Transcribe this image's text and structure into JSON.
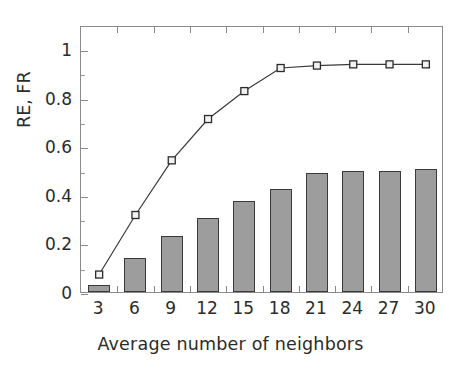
{
  "chart_data": {
    "type": "bar",
    "title": "",
    "subtitle": "",
    "xlabel": "Average number of neighbors",
    "ylabel": "RE, FR",
    "categories": [
      "3",
      "6",
      "9",
      "12",
      "15",
      "18",
      "21",
      "24",
      "27",
      "30"
    ],
    "x": [
      3,
      6,
      9,
      12,
      15,
      18,
      21,
      24,
      27,
      30
    ],
    "xlim": [
      1.5,
      31.5
    ],
    "ylim": [
      0,
      1.1
    ],
    "yticks": [
      0,
      0.2,
      0.4,
      0.6,
      0.8,
      1
    ],
    "ytick_labels": [
      "0",
      "0.2",
      "0.4",
      "0.6",
      "0.8",
      "1"
    ],
    "grid": false,
    "legend": "none",
    "series": [
      {
        "name": "RE",
        "render": "bar",
        "marker": "none",
        "fill_color": "#9d9d9d",
        "edge_color": "#3a3a3a",
        "values": [
          0.03,
          0.14,
          0.23,
          0.305,
          0.375,
          0.425,
          0.49,
          0.5,
          0.5,
          0.505
        ]
      },
      {
        "name": "FR",
        "render": "line",
        "marker": "open-square",
        "line_color": "#3a3a3a",
        "marker_fill": "#f2f2f2",
        "marker_edge": "#2b2b2b",
        "values": [
          0.08,
          0.325,
          0.55,
          0.72,
          0.835,
          0.93,
          0.94,
          0.945,
          0.945,
          0.945
        ]
      }
    ]
  },
  "axes": {
    "ytick_labels": [
      "1",
      "0.8",
      "0.6",
      "0.4",
      "0.2",
      "0"
    ],
    "xtick_labels": [
      "3",
      "6",
      "9",
      "12",
      "15",
      "18",
      "21",
      "24",
      "27",
      "30"
    ],
    "xaxis_title": "Average number of neighbors",
    "yaxis_title": "RE, FR"
  },
  "style": {
    "frame_color": "#8a8a8a",
    "bar_fill": "#9d9d9d",
    "bar_edge": "#3a3a3a",
    "line_color": "#3a3a3a",
    "text_color": "#2b2b2b",
    "background": "#ffffff"
  }
}
